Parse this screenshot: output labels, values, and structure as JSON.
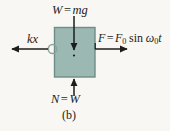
{
  "figure": {
    "caption": "(b)",
    "background_color": "#f8f7f3",
    "block": {
      "fill_color": "#9cb8b2",
      "stroke_color": "#6f8d88",
      "x": 54,
      "y": 27,
      "width": 41,
      "height": 50
    },
    "arrow_color": "#1d1d1b"
  },
  "labels": {
    "weight": {
      "text": "W = mg",
      "var1": "W",
      "equals": "=",
      "var2": "mg"
    },
    "spring": {
      "text": "kx",
      "var1": "k",
      "var2": "x"
    },
    "driving_force": {
      "text": "F = F0 sin ω0t",
      "var1": "F",
      "equals": "=",
      "amplitude": "F",
      "amplitude_sub": "0",
      "func": "sin",
      "omega": "ω",
      "omega_sub": "0",
      "time": "t"
    },
    "normal": {
      "text": "N = W",
      "var1": "N",
      "equals": "=",
      "var2": "W"
    }
  },
  "vectors": [
    {
      "name": "weight-arrow",
      "direction": "down",
      "from": [
        74,
        16
      ],
      "to": [
        74,
        52
      ]
    },
    {
      "name": "spring-force-arrow",
      "direction": "left",
      "from": [
        48,
        49
      ],
      "to": [
        10,
        49
      ]
    },
    {
      "name": "driving-force-arrow",
      "direction": "right",
      "from": [
        95,
        49
      ],
      "to": [
        129,
        49
      ]
    },
    {
      "name": "normal-force-arrow",
      "direction": "up",
      "from": [
        74,
        96
      ],
      "to": [
        74,
        77
      ]
    }
  ]
}
